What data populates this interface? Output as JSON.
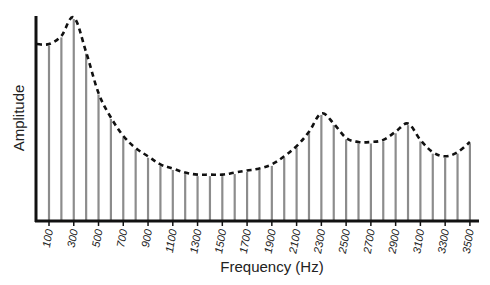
{
  "chart_data": {
    "type": "bar",
    "style": "stem spectrum with dashed envelope",
    "title": "",
    "xlabel": "Frequency (Hz)",
    "ylabel": "Amplitude",
    "x": [
      100,
      200,
      300,
      400,
      500,
      600,
      700,
      800,
      900,
      1000,
      1100,
      1200,
      1300,
      1400,
      1500,
      1600,
      1700,
      1800,
      1900,
      2000,
      2100,
      2200,
      2300,
      2400,
      2500,
      2600,
      2700,
      2800,
      2900,
      3000,
      3100,
      3200,
      3300,
      3400,
      3500
    ],
    "values": [
      86,
      90,
      99,
      82,
      62,
      50,
      41,
      35,
      31,
      27,
      25,
      23,
      22,
      22,
      22,
      23,
      24,
      25,
      27,
      31,
      36,
      43,
      52,
      47,
      40,
      38,
      38,
      39,
      43,
      47,
      39,
      33,
      31,
      33,
      38
    ],
    "tick_labels": [
      "100",
      "300",
      "500",
      "700",
      "900",
      "1100",
      "1300",
      "1500",
      "1700",
      "1900",
      "2100",
      "2300",
      "2500",
      "2700",
      "2900",
      "3100",
      "3300",
      "3500"
    ],
    "ylim": [
      0,
      100
    ],
    "y_ticks_shown": false,
    "grid": false,
    "legend": null,
    "colors": {
      "bars": "#8c8c8c",
      "envelope": "#111111",
      "axes": "#111111"
    }
  },
  "labels": {
    "xlabel": "Frequency (Hz)",
    "ylabel": "Amplitude"
  }
}
